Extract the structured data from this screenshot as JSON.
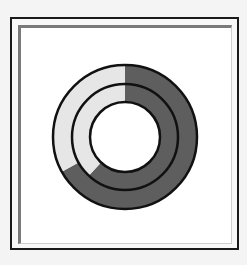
{
  "chart_data": {
    "type": "pie",
    "subtype": "nested-donut",
    "title": "",
    "series": [
      {
        "name": "outer",
        "values": [
          67,
          33
        ],
        "colors": [
          "#5e5e5e",
          "#e6e6e6"
        ]
      },
      {
        "name": "inner",
        "values": [
          62,
          38
        ],
        "colors": [
          "#5e5e5e",
          "#e6e6e6"
        ]
      }
    ],
    "start_angle": "12 o'clock",
    "direction": "clockwise"
  }
}
